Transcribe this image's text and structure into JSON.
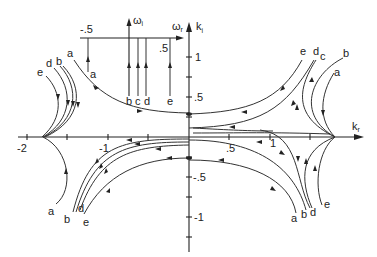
{
  "main_axes": {
    "x_label": "k",
    "x_sub": "r",
    "y_label": "k",
    "y_sub": "i",
    "x_ticks": [
      "-2",
      "-1",
      ".5",
      "1"
    ],
    "y_ticks": [
      "1",
      ".5",
      "-.5",
      "-1"
    ]
  },
  "inset_axes": {
    "x_label": "ω",
    "x_sub": "r",
    "y_label": "ω",
    "y_sub": "i",
    "x_ticks": [
      "-.5",
      ".5"
    ]
  },
  "inset_lines": {
    "a": "a",
    "b": "b",
    "c": "c",
    "d": "d",
    "e": "e"
  },
  "curve_labels": {
    "upper_left": [
      "e",
      "d",
      "b"
    ],
    "upper_middle_a": "a",
    "upper_right": [
      "e",
      "d",
      "c",
      "b",
      "a"
    ],
    "lower_left": [
      "a",
      "b",
      "d",
      "e"
    ],
    "lower_right": [
      "a",
      "b",
      "d",
      "e"
    ]
  },
  "colors": {
    "ink": "#222222",
    "background": "#ffffff"
  }
}
